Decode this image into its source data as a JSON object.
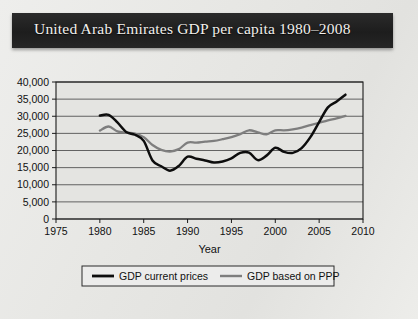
{
  "title": "United Arab Emirates GDP per capita 1980–2008",
  "chart_data": {
    "type": "line",
    "title": "United Arab Emirates GDP per capita 1980–2008",
    "xlabel": "Year",
    "ylabel": "",
    "xlim": [
      1975,
      2010
    ],
    "ylim": [
      0,
      40000
    ],
    "xticks": [
      1975,
      1980,
      1985,
      1990,
      1995,
      2000,
      2005,
      2010
    ],
    "xtick_labels": [
      "1975",
      "1980",
      "1985",
      "1990",
      "1995",
      "2000",
      "2005",
      "2010"
    ],
    "yticks": [
      0,
      5000,
      10000,
      15000,
      20000,
      25000,
      30000,
      35000,
      40000
    ],
    "ytick_labels": [
      "0",
      "5,000",
      "10,000",
      "15,000",
      "20,000",
      "25,000",
      "30,000",
      "35,000",
      "40,000"
    ],
    "grid": true,
    "legend_position": "bottom",
    "x": [
      1980,
      1981,
      1982,
      1983,
      1984,
      1985,
      1986,
      1987,
      1988,
      1989,
      1990,
      1991,
      1992,
      1993,
      1994,
      1995,
      1996,
      1997,
      1998,
      1999,
      2000,
      2001,
      2002,
      2003,
      2004,
      2005,
      2006,
      2007,
      2008
    ],
    "series": [
      {
        "name": "GDP current prices",
        "color": "#0d0d0d",
        "values": [
          30200,
          30400,
          28200,
          25400,
          24600,
          22800,
          17100,
          15400,
          14100,
          15500,
          18200,
          17600,
          17100,
          16500,
          16800,
          17700,
          19300,
          19400,
          17200,
          18500,
          20800,
          19600,
          19300,
          20700,
          23900,
          28300,
          32600,
          34300,
          36300
        ]
      },
      {
        "name": "GDP based on PPP",
        "color": "#7e7e7e",
        "values": [
          25800,
          27000,
          25600,
          25200,
          24900,
          23900,
          21600,
          20200,
          19700,
          20400,
          22300,
          22300,
          22600,
          22800,
          23300,
          23900,
          24800,
          25900,
          25300,
          24700,
          25900,
          25900,
          26200,
          26700,
          27400,
          28100,
          28800,
          29400,
          30100
        ]
      }
    ]
  },
  "axis": {
    "x_label": "Year"
  },
  "legend": {
    "items": [
      {
        "label": "GDP current prices",
        "color": "#0d0d0d"
      },
      {
        "label": "GDP based on PPP",
        "color": "#7e7e7e"
      }
    ]
  }
}
